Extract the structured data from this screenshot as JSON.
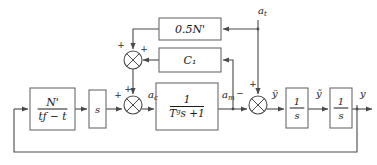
{
  "diagram": {
    "type": "control-system-block-diagram",
    "colors": {
      "line": "#4a4a4a",
      "block_border": "#6b6b6b",
      "text": "#1a1a1a",
      "background": "#ffffff"
    },
    "blocks": [
      {
        "id": "nav-gain",
        "name": "navigation-gain-block",
        "numerator": "N'",
        "denominator": "tƒ − t",
        "kind": "fraction",
        "x": 30,
        "y": 88,
        "w": 45,
        "h": 42
      },
      {
        "id": "derivative",
        "name": "derivative-block",
        "label": "s",
        "kind": "plain",
        "x": 89,
        "y": 90,
        "w": 17,
        "h": 38
      },
      {
        "id": "half-n",
        "name": "half-nav-gain-block",
        "label": "0.5N'",
        "kind": "plain",
        "x": 159,
        "y": 18,
        "w": 62,
        "h": 22
      },
      {
        "id": "c1",
        "name": "c1-gain-block",
        "label": "C₁",
        "kind": "plain",
        "x": 159,
        "y": 48,
        "w": 62,
        "h": 24
      },
      {
        "id": "lag",
        "name": "autopilot-lag-block",
        "numerator": "1",
        "denominator": "Tₘs + 1",
        "denominator_display": "Tᵍs +1",
        "kind": "fraction",
        "x": 156,
        "y": 83,
        "w": 62,
        "h": 47
      },
      {
        "id": "integrator-1",
        "name": "first-integrator-block",
        "numerator": "1",
        "denominator": "s",
        "kind": "fraction",
        "x": 286,
        "y": 88,
        "w": 22,
        "h": 40
      },
      {
        "id": "integrator-2",
        "name": "second-integrator-block",
        "numerator": "1",
        "denominator": "s",
        "kind": "fraction",
        "x": 330,
        "y": 88,
        "w": 22,
        "h": 40
      }
    ],
    "summing_junctions": [
      {
        "id": "sum-upper",
        "name": "upper-summing-junction",
        "cx": 133,
        "cy": 60,
        "r": 9,
        "signs": [
          {
            "label": "+",
            "position": "top-left",
            "x": 121,
            "y": 48
          },
          {
            "label": "+",
            "position": "right-top",
            "x": 144,
            "y": 52
          }
        ]
      },
      {
        "id": "sum-command",
        "name": "command-summing-junction",
        "cx": 133,
        "cy": 105,
        "r": 9,
        "signs": [
          {
            "label": "+",
            "position": "left",
            "x": 118,
            "y": 98
          },
          {
            "label": "+",
            "position": "top",
            "x": 128,
            "y": 92
          }
        ]
      },
      {
        "id": "sum-relative",
        "name": "relative-acceleration-summing-junction",
        "cx": 258,
        "cy": 105,
        "r": 9,
        "signs": [
          {
            "label": "+",
            "position": "top",
            "x": 253,
            "y": 87
          },
          {
            "label": "−",
            "position": "left",
            "x": 240,
            "y": 96
          }
        ]
      }
    ],
    "signal_labels": [
      {
        "id": "a-c",
        "name": "commanded-acceleration-label",
        "text": "a",
        "sub": "c",
        "x": 148,
        "y": 98
      },
      {
        "id": "a-m",
        "name": "missile-acceleration-label",
        "text": "a",
        "sub": "m",
        "x": 222,
        "y": 98
      },
      {
        "id": "a-t",
        "name": "target-acceleration-label",
        "text": "a",
        "sub": "t",
        "x": 258,
        "y": 14
      },
      {
        "id": "y-ddot",
        "name": "relative-acceleration-label",
        "text": "ÿ",
        "sub": "",
        "x": 272,
        "y": 97
      },
      {
        "id": "y-dot",
        "name": "relative-velocity-label",
        "text": "ỹ",
        "sub": "",
        "x": 316,
        "y": 97
      },
      {
        "id": "y-out",
        "name": "relative-position-label",
        "text": "y",
        "sub": "",
        "x": 360,
        "y": 97
      }
    ]
  }
}
